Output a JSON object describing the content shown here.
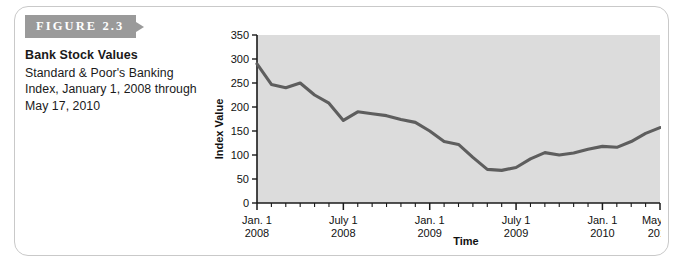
{
  "figure": {
    "tag": "FIGURE 2.3",
    "title": "Bank Stock Values",
    "subtitle": "Standard & Poor's Banking Index, January 1, 2008 through May 17, 2010"
  },
  "colors": {
    "tag_background": "#9a9a9a",
    "plot_background": "#dcdcdc",
    "line": "#5e5e5e",
    "axis": "#1a1a1a",
    "card_border": "#c9c9c9"
  },
  "chart_data": {
    "type": "line",
    "title": "Bank Stock Values",
    "xlabel": "Time",
    "ylabel": "Index Value",
    "ylim": [
      0,
      350
    ],
    "yticks": [
      0,
      50,
      100,
      150,
      200,
      250,
      300,
      350
    ],
    "grid": false,
    "legend": "none",
    "x_tick_labels": [
      {
        "line1": "Jan. 1",
        "line2": "2008"
      },
      {
        "line1": "July 1",
        "line2": "2008"
      },
      {
        "line1": "Jan. 1",
        "line2": "2009"
      },
      {
        "line1": "July 1",
        "line2": "2009"
      },
      {
        "line1": "Jan. 1",
        "line2": "2010"
      },
      {
        "line1": "May 17",
        "line2": "2010"
      }
    ],
    "x": [
      "2008-01",
      "2008-02",
      "2008-03",
      "2008-04",
      "2008-05",
      "2008-06",
      "2008-07",
      "2008-08",
      "2008-09",
      "2008-10",
      "2008-11",
      "2008-12",
      "2009-01",
      "2009-02",
      "2009-03",
      "2009-04",
      "2009-05",
      "2009-06",
      "2009-07",
      "2009-08",
      "2009-09",
      "2009-10",
      "2009-11",
      "2009-12",
      "2010-01",
      "2010-02",
      "2010-03",
      "2010-04",
      "2010-05"
    ],
    "values": [
      290,
      247,
      240,
      250,
      225,
      208,
      172,
      190,
      186,
      182,
      174,
      168,
      150,
      128,
      122,
      95,
      70,
      68,
      74,
      92,
      105,
      100,
      104,
      112,
      118,
      116,
      128,
      145,
      157
    ],
    "series": [
      {
        "name": "S&P Banking Index",
        "values": [
          290,
          247,
          240,
          250,
          225,
          208,
          172,
          190,
          186,
          182,
          174,
          168,
          150,
          128,
          122,
          95,
          70,
          68,
          74,
          92,
          105,
          100,
          104,
          112,
          118,
          116,
          128,
          145,
          157
        ]
      }
    ],
    "annotations": {
      "start_value": 290,
      "minimum_value": 68,
      "end_value": 157
    }
  }
}
